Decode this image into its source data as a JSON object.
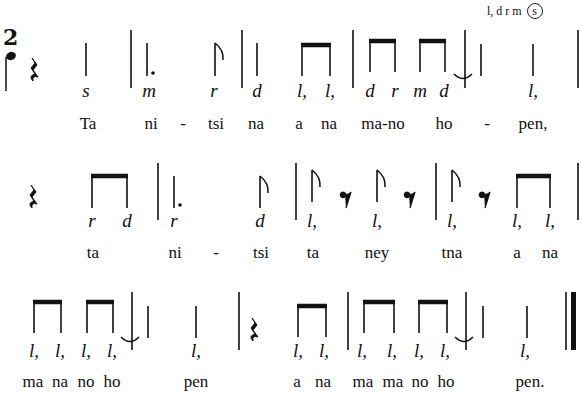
{
  "key_signature": {
    "scale": "l, d r m",
    "tonic_circled": "s"
  },
  "time_signature": {
    "beats": "2",
    "unit": "quarter-note"
  },
  "rows": [
    {
      "solfege": [
        {
          "x": 86,
          "t": "s"
        },
        {
          "x": 149,
          "t": "m"
        },
        {
          "x": 214,
          "t": "r"
        },
        {
          "x": 257,
          "t": "d"
        },
        {
          "x": 302,
          "t": "l,"
        },
        {
          "x": 330,
          "t": "l,"
        },
        {
          "x": 370,
          "t": "d"
        },
        {
          "x": 395,
          "t": "r"
        },
        {
          "x": 420,
          "t": "m"
        },
        {
          "x": 444,
          "t": "d"
        },
        {
          "x": 533,
          "t": "l,"
        }
      ],
      "lyrics": [
        {
          "x": 88,
          "t": "Ta"
        },
        {
          "x": 151,
          "t": "ni"
        },
        {
          "x": 183,
          "t": "-"
        },
        {
          "x": 216,
          "t": "tsi"
        },
        {
          "x": 256,
          "t": "na"
        },
        {
          "x": 299,
          "t": "a"
        },
        {
          "x": 329,
          "t": "na"
        },
        {
          "x": 383,
          "t": "ma-no"
        },
        {
          "x": 444,
          "t": "ho"
        },
        {
          "x": 487,
          "t": "-"
        },
        {
          "x": 533,
          "t": "pen,"
        }
      ]
    },
    {
      "solfege": [
        {
          "x": 92,
          "t": "r"
        },
        {
          "x": 127,
          "t": "d"
        },
        {
          "x": 174,
          "t": "r"
        },
        {
          "x": 260,
          "t": "d"
        },
        {
          "x": 312,
          "t": "l,"
        },
        {
          "x": 377,
          "t": "l,"
        },
        {
          "x": 452,
          "t": "l,"
        },
        {
          "x": 517,
          "t": "l,"
        },
        {
          "x": 550,
          "t": "l,"
        }
      ],
      "lyrics": [
        {
          "x": 93,
          "t": "ta"
        },
        {
          "x": 175,
          "t": "ni"
        },
        {
          "x": 216,
          "t": "-"
        },
        {
          "x": 261,
          "t": "tsi"
        },
        {
          "x": 313,
          "t": "ta"
        },
        {
          "x": 377,
          "t": "ney"
        },
        {
          "x": 452,
          "t": "tna"
        },
        {
          "x": 517,
          "t": "a"
        },
        {
          "x": 550,
          "t": "na"
        }
      ]
    },
    {
      "solfege": [
        {
          "x": 34,
          "t": "l,"
        },
        {
          "x": 60,
          "t": "l,"
        },
        {
          "x": 86,
          "t": "l,"
        },
        {
          "x": 112,
          "t": "l,"
        },
        {
          "x": 196,
          "t": "l,"
        },
        {
          "x": 298,
          "t": "l,"
        },
        {
          "x": 324,
          "t": "l,"
        },
        {
          "x": 362,
          "t": "l,"
        },
        {
          "x": 392,
          "t": "l,"
        },
        {
          "x": 419,
          "t": "l,"
        },
        {
          "x": 445,
          "t": "l,"
        },
        {
          "x": 525,
          "t": "l,"
        }
      ],
      "lyrics": [
        {
          "x": 33,
          "t": "ma"
        },
        {
          "x": 60,
          "t": "na"
        },
        {
          "x": 86,
          "t": "no"
        },
        {
          "x": 112,
          "t": "ho"
        },
        {
          "x": 196,
          "t": "pen"
        },
        {
          "x": 297,
          "t": "a"
        },
        {
          "x": 323,
          "t": "na"
        },
        {
          "x": 363,
          "t": "ma"
        },
        {
          "x": 393,
          "t": "ma"
        },
        {
          "x": 420,
          "t": "no"
        },
        {
          "x": 446,
          "t": "ho"
        },
        {
          "x": 530,
          "t": "pen."
        }
      ]
    }
  ]
}
